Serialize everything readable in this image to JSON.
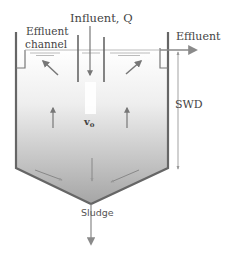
{
  "diagram": {
    "labels": {
      "influent": "Influent, Q",
      "effluent_channel_line1": "Effluent",
      "effluent_channel_line2": "channel",
      "effluent": "Effluent",
      "swd": "SWD",
      "overflow_velocity": "v",
      "overflow_velocity_sub": "o",
      "sludge": "Sludge"
    },
    "colors": {
      "wall": "#666666",
      "arrow": "#777777",
      "text": "#444444",
      "liquid_top": "#f4f4f4",
      "liquid_bottom": "#a9a9a9",
      "background": "#ffffff"
    },
    "flows": [
      {
        "name": "influent",
        "direction": "down"
      },
      {
        "name": "effluent",
        "direction": "right"
      },
      {
        "name": "upflow-left",
        "direction": "up"
      },
      {
        "name": "upflow-right",
        "direction": "up"
      },
      {
        "name": "sludge",
        "direction": "down"
      }
    ]
  }
}
